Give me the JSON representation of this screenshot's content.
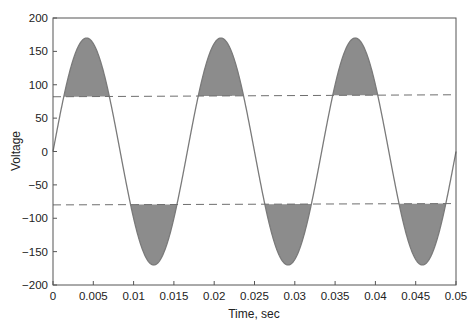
{
  "chart_data": {
    "type": "line",
    "title": "",
    "xlabel": "Time, sec",
    "ylabel": "Voltage",
    "xlim": [
      0,
      0.05
    ],
    "ylim": [
      -200,
      200
    ],
    "grid": false,
    "legend": null,
    "x_ticks": [
      "0",
      "0.005",
      "0.01",
      "0.015",
      "0.02",
      "0.025",
      "0.03",
      "0.035",
      "0.04",
      "0.045",
      "0.05"
    ],
    "y_ticks": [
      "200",
      "150",
      "100",
      "50",
      "0",
      "−50",
      "−100",
      "−150",
      "−200"
    ],
    "x_tick_values": [
      0,
      0.005,
      0.01,
      0.015,
      0.02,
      0.025,
      0.03,
      0.035,
      0.04,
      0.045,
      0.05
    ],
    "y_tick_values": [
      200,
      150,
      100,
      50,
      0,
      -50,
      -100,
      -150,
      -200
    ],
    "series": [
      {
        "name": "Sinusoidal voltage",
        "function": "170*sin(2*pi*60*t)",
        "amplitude": 170,
        "frequency_hz": 60,
        "style": "solid"
      }
    ],
    "threshold_lines": [
      {
        "name": "upper threshold",
        "y_start": 82,
        "y_end": 85,
        "style": "dashed"
      },
      {
        "name": "lower threshold",
        "y_start": -80,
        "y_end": -78,
        "style": "dashed"
      }
    ],
    "shaded_regions": "Areas where |voltage| exceeds the dashed threshold lines (peaks above upper line and troughs below lower line)",
    "colors": {
      "curve": "#7a7a7a",
      "fill": "#8c8c8c",
      "dashed": "#6e6e6e",
      "axis": "#555555"
    }
  }
}
